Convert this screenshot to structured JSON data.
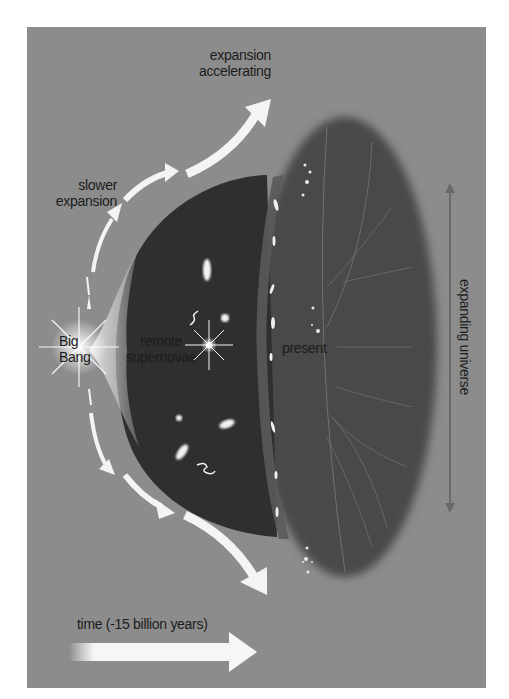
{
  "diagram": {
    "type": "universe-expansion-timeline",
    "colors": {
      "background": "#8c8c8c",
      "inner_dome": "#2f2f2f",
      "outer_disk": "#4a4a4a",
      "arrows": "#f4f4f4",
      "vertical_arrow": "#6a6a6a",
      "text": "#1c1c1c"
    },
    "labels": {
      "expansion_accelerating": [
        "expansion",
        "accelerating"
      ],
      "slower_expansion": [
        "slower",
        "expansion"
      ],
      "big_bang": [
        "Big",
        "Bang"
      ],
      "remote_supernovae": [
        "remote",
        "supernovae"
      ],
      "present": "present",
      "expanding_universe": "expanding universe",
      "time": "time (-15 billion years)"
    },
    "elements": [
      {
        "name": "big-bang-star",
        "kind": "starburst"
      },
      {
        "name": "remote-supernova-star",
        "kind": "starburst"
      },
      {
        "name": "inner-dome",
        "kind": "dark-region",
        "meaning": "past universe"
      },
      {
        "name": "outer-disk",
        "kind": "dark-region",
        "meaning": "present universe"
      },
      {
        "name": "upper-expansion-arrows",
        "kind": "curved-arrow-sequence",
        "direction": "up-right",
        "count": 4
      },
      {
        "name": "lower-expansion-arrows",
        "kind": "curved-arrow-sequence",
        "direction": "down-right",
        "count": 4
      },
      {
        "name": "expanding-universe-arrow",
        "kind": "double-headed-arrow",
        "orientation": "vertical"
      },
      {
        "name": "time-arrow",
        "kind": "arrow",
        "direction": "right"
      }
    ]
  }
}
